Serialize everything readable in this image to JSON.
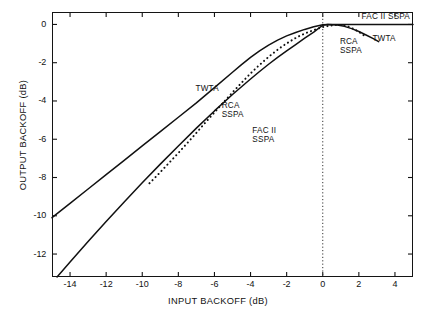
{
  "chart_data": {
    "type": "line",
    "title": "",
    "xlabel": "INPUT BACKOFF (dB)",
    "ylabel": "OUTPUT BACKOFF (dB)",
    "xlim": [
      -15,
      5
    ],
    "ylim": [
      -13.2,
      0.65
    ],
    "xticks": [
      -14,
      -12,
      -10,
      -8,
      -6,
      -4,
      -2,
      0,
      2,
      4
    ],
    "xtick_labels": [
      "-14",
      "-12",
      "-10",
      "-8",
      "-6",
      "-4",
      "-2",
      "0",
      "2",
      "4"
    ],
    "yticks": [
      0,
      -2,
      -4,
      -6,
      -8,
      -10,
      -12
    ],
    "ytick_labels": [
      "0",
      "-2",
      "-4",
      "-6",
      "-8",
      "-10",
      "-12"
    ],
    "grid": false,
    "legend_position": "inline-annotations",
    "annotations": [
      {
        "text": "TWTA",
        "x": -7.05,
        "y": -3.35,
        "name": "label-twta-left"
      },
      {
        "text": "RCA\nSSPA",
        "x": -5.6,
        "y": -4.25,
        "name": "label-rca-sspa-left"
      },
      {
        "text": "FAC II\nSSPA",
        "x": -3.9,
        "y": -5.55,
        "name": "label-fac-ii-sspa-left"
      },
      {
        "text": "FAC II SSPA",
        "x": 2.15,
        "y": 0.38,
        "name": "label-fac-ii-sspa-right"
      },
      {
        "text": "TWTA",
        "x": 2.75,
        "y": -0.78,
        "name": "label-twta-right"
      },
      {
        "text": "RCA\nSSPA",
        "x": 0.95,
        "y": -0.9,
        "name": "label-rca-sspa-right"
      }
    ],
    "reference_lines": [
      {
        "name": "zero-input-backoff-marker",
        "orientation": "vertical",
        "x": 0,
        "style": "dotted"
      }
    ],
    "series": [
      {
        "name": "TWTA",
        "style": "solid",
        "color": "#111111",
        "points": [
          [
            -15.0,
            -10.1
          ],
          [
            -14.0,
            -9.35
          ],
          [
            -13.0,
            -8.6
          ],
          [
            -12.0,
            -7.85
          ],
          [
            -11.0,
            -7.1
          ],
          [
            -10.0,
            -6.35
          ],
          [
            -9.0,
            -5.6
          ],
          [
            -8.0,
            -4.85
          ],
          [
            -7.0,
            -4.1
          ],
          [
            -6.0,
            -3.3
          ],
          [
            -5.0,
            -2.5
          ],
          [
            -4.5,
            -2.1
          ],
          [
            -4.0,
            -1.72
          ],
          [
            -3.5,
            -1.38
          ],
          [
            -3.0,
            -1.08
          ],
          [
            -2.5,
            -0.82
          ],
          [
            -2.0,
            -0.6
          ],
          [
            -1.5,
            -0.42
          ],
          [
            -1.0,
            -0.26
          ],
          [
            -0.5,
            -0.12
          ],
          [
            0.0,
            -0.02
          ],
          [
            0.3,
            0.0
          ],
          [
            0.8,
            -0.03
          ],
          [
            1.2,
            -0.1
          ],
          [
            1.6,
            -0.22
          ],
          [
            2.0,
            -0.37
          ],
          [
            2.4,
            -0.55
          ],
          [
            2.8,
            -0.74
          ],
          [
            3.1,
            -0.9
          ]
        ]
      },
      {
        "name": "RCA SSPA",
        "style": "dotted",
        "color": "#111111",
        "points": [
          [
            -9.6,
            -8.3
          ],
          [
            -9.2,
            -7.92
          ],
          [
            -8.8,
            -7.52
          ],
          [
            -8.4,
            -7.12
          ],
          [
            -8.0,
            -6.72
          ],
          [
            -7.6,
            -6.3
          ],
          [
            -7.2,
            -5.88
          ],
          [
            -6.8,
            -5.45
          ],
          [
            -6.4,
            -5.02
          ],
          [
            -6.0,
            -4.6
          ],
          [
            -5.6,
            -4.18
          ],
          [
            -5.2,
            -3.76
          ],
          [
            -4.8,
            -3.35
          ],
          [
            -4.4,
            -2.95
          ],
          [
            -4.0,
            -2.56
          ],
          [
            -3.6,
            -2.2
          ],
          [
            -3.2,
            -1.86
          ],
          [
            -2.8,
            -1.54
          ],
          [
            -2.4,
            -1.25
          ],
          [
            -2.0,
            -0.99
          ],
          [
            -1.6,
            -0.76
          ],
          [
            -1.2,
            -0.56
          ],
          [
            -0.8,
            -0.4
          ],
          [
            -0.4,
            -0.26
          ],
          [
            0.0,
            -0.14
          ],
          [
            0.4,
            -0.06
          ],
          [
            0.8,
            -0.02
          ],
          [
            1.2,
            -0.05
          ],
          [
            1.5,
            -0.14
          ],
          [
            1.8,
            -0.28
          ],
          [
            2.1,
            -0.45
          ],
          [
            2.35,
            -0.62
          ]
        ]
      },
      {
        "name": "FAC II SSPA",
        "style": "solid",
        "color": "#111111",
        "points": [
          [
            -14.72,
            -13.2
          ],
          [
            -14.0,
            -12.42
          ],
          [
            -13.0,
            -11.35
          ],
          [
            -12.0,
            -10.3
          ],
          [
            -11.0,
            -9.28
          ],
          [
            -10.0,
            -8.28
          ],
          [
            -9.0,
            -7.3
          ],
          [
            -8.0,
            -6.35
          ],
          [
            -7.0,
            -5.42
          ],
          [
            -6.0,
            -4.52
          ],
          [
            -5.0,
            -3.66
          ],
          [
            -4.0,
            -2.85
          ],
          [
            -3.5,
            -2.46
          ],
          [
            -3.0,
            -2.08
          ],
          [
            -2.5,
            -1.72
          ],
          [
            -2.0,
            -1.38
          ],
          [
            -1.5,
            -1.05
          ],
          [
            -1.0,
            -0.72
          ],
          [
            -0.5,
            -0.4
          ],
          [
            -0.2,
            -0.18
          ],
          [
            0.0,
            -0.05
          ],
          [
            0.25,
            0.0
          ],
          [
            1.0,
            0.0
          ],
          [
            2.0,
            0.0
          ],
          [
            3.0,
            0.0
          ],
          [
            4.0,
            0.0
          ],
          [
            5.0,
            0.0
          ]
        ]
      }
    ]
  }
}
